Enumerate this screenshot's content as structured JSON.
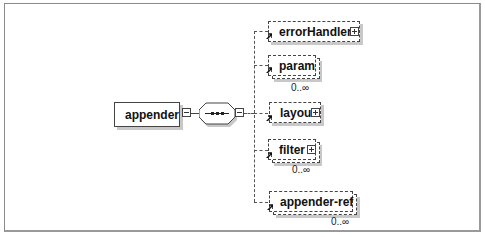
{
  "diagram": {
    "root": {
      "label": "appender",
      "expander": "minus"
    },
    "compositor": {
      "type": "sequence",
      "expander": "minus"
    },
    "children": [
      {
        "label": "errorHandler",
        "optional": true,
        "multiple": false,
        "expander": "plus",
        "occurrence": ""
      },
      {
        "label": "param",
        "optional": true,
        "multiple": true,
        "expander": "",
        "occurrence": "0..∞"
      },
      {
        "label": "layout",
        "optional": true,
        "multiple": false,
        "expander": "plus",
        "occurrence": ""
      },
      {
        "label": "filter",
        "optional": true,
        "multiple": true,
        "expander": "plus",
        "occurrence": "0..∞"
      },
      {
        "label": "appender-ref",
        "optional": true,
        "multiple": true,
        "expander": "",
        "occurrence": "0..∞"
      }
    ]
  }
}
